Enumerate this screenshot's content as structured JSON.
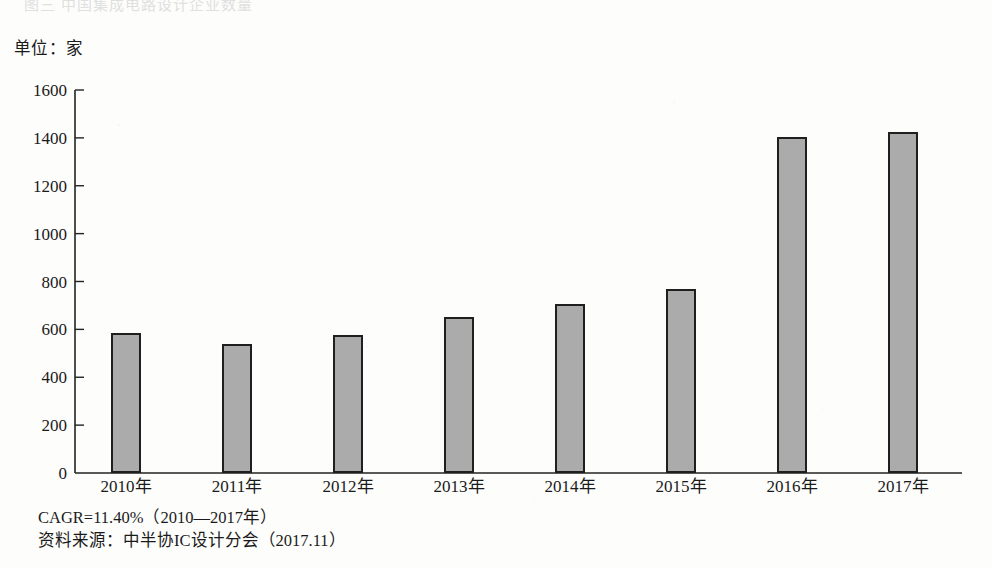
{
  "page": {
    "cut_off_heading": "图三  中国集成电路设计企业数量",
    "unit_label": "单位：家"
  },
  "footnotes": {
    "cagr": "CAGR=11.40%（2010—2017年）",
    "source": "资料来源：中半协IC设计分会（2017.11）"
  },
  "colors": {
    "bar_fill": "#ababab",
    "bar_border": "#1f1f1f",
    "axis": "#222222",
    "background": "#fdfdfc"
  },
  "chart_data": {
    "type": "bar",
    "title": "",
    "xlabel": "",
    "ylabel": "单位：家",
    "ylim": [
      0,
      1600
    ],
    "yticks": [
      0,
      200,
      400,
      600,
      800,
      1000,
      1200,
      1400,
      1600
    ],
    "ytick_labels": [
      "0",
      "200",
      "400",
      "600",
      "800",
      "1000",
      "1200",
      "1400",
      "1600"
    ],
    "grid": false,
    "legend": false,
    "categories": [
      "2010年",
      "2011年",
      "2012年",
      "2013年",
      "2014年",
      "2015年",
      "2016年",
      "2017年"
    ],
    "values": [
      585,
      537,
      578,
      650,
      705,
      770,
      1405,
      1425
    ],
    "annotations": [
      "CAGR=11.40%（2010—2017年）",
      "资料来源：中半协IC设计分会（2017.11）"
    ]
  }
}
